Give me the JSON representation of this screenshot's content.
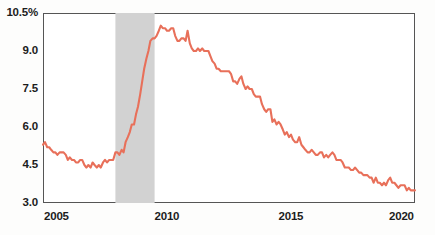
{
  "chart_data": {
    "type": "line",
    "title": "",
    "subtitle": "",
    "xlabel": "",
    "ylabel": "",
    "xlim": [
      2005.0,
      2020.0
    ],
    "ylim": [
      3.0,
      10.5
    ],
    "grid": false,
    "legend": "none",
    "line_color": "#e8705a",
    "recession_band_color": "#d2d2d2",
    "frame_color": "#555555",
    "y_ticks": [
      {
        "value": 3.0,
        "label": "3.0"
      },
      {
        "value": 4.5,
        "label": "4.5"
      },
      {
        "value": 6.0,
        "label": "6.0"
      },
      {
        "value": 7.5,
        "label": "7.5"
      },
      {
        "value": 9.0,
        "label": "9.0"
      },
      {
        "value": 10.5,
        "label": "10.5%"
      }
    ],
    "x_ticks": [
      {
        "value": 2005,
        "label": "2005"
      },
      {
        "value": 2010,
        "label": "2010"
      },
      {
        "value": 2015,
        "label": "2015"
      },
      {
        "value": 2020,
        "label": "2020"
      }
    ],
    "annotations": [
      {
        "type": "shaded-band",
        "name": "recession-band",
        "x_start": 2007.92,
        "x_end": 2009.5
      }
    ],
    "series": [
      {
        "name": "Unemployment rate",
        "x": [
          2005.0,
          2005.08,
          2005.17,
          2005.25,
          2005.33,
          2005.42,
          2005.5,
          2005.58,
          2005.67,
          2005.75,
          2005.83,
          2005.92,
          2006.0,
          2006.08,
          2006.17,
          2006.25,
          2006.33,
          2006.42,
          2006.5,
          2006.58,
          2006.67,
          2006.75,
          2006.83,
          2006.92,
          2007.0,
          2007.08,
          2007.17,
          2007.25,
          2007.33,
          2007.42,
          2007.5,
          2007.58,
          2007.67,
          2007.75,
          2007.83,
          2007.92,
          2008.0,
          2008.08,
          2008.17,
          2008.25,
          2008.33,
          2008.42,
          2008.5,
          2008.58,
          2008.67,
          2008.75,
          2008.83,
          2008.92,
          2009.0,
          2009.08,
          2009.17,
          2009.25,
          2009.33,
          2009.42,
          2009.5,
          2009.58,
          2009.67,
          2009.75,
          2009.83,
          2009.92,
          2010.0,
          2010.08,
          2010.17,
          2010.25,
          2010.33,
          2010.42,
          2010.5,
          2010.58,
          2010.67,
          2010.75,
          2010.83,
          2010.92,
          2011.0,
          2011.08,
          2011.17,
          2011.25,
          2011.33,
          2011.42,
          2011.5,
          2011.58,
          2011.67,
          2011.75,
          2011.83,
          2011.92,
          2012.0,
          2012.08,
          2012.17,
          2012.25,
          2012.33,
          2012.42,
          2012.5,
          2012.58,
          2012.67,
          2012.75,
          2012.83,
          2012.92,
          2013.0,
          2013.08,
          2013.17,
          2013.25,
          2013.33,
          2013.42,
          2013.5,
          2013.58,
          2013.67,
          2013.75,
          2013.83,
          2013.92,
          2014.0,
          2014.08,
          2014.17,
          2014.25,
          2014.33,
          2014.42,
          2014.5,
          2014.58,
          2014.67,
          2014.75,
          2014.83,
          2014.92,
          2015.0,
          2015.08,
          2015.17,
          2015.25,
          2015.33,
          2015.42,
          2015.5,
          2015.58,
          2015.67,
          2015.75,
          2015.83,
          2015.92,
          2016.0,
          2016.08,
          2016.17,
          2016.25,
          2016.33,
          2016.42,
          2016.5,
          2016.58,
          2016.67,
          2016.75,
          2016.83,
          2016.92,
          2017.0,
          2017.08,
          2017.17,
          2017.25,
          2017.33,
          2017.42,
          2017.5,
          2017.58,
          2017.67,
          2017.75,
          2017.83,
          2017.92,
          2018.0,
          2018.08,
          2018.17,
          2018.25,
          2018.33,
          2018.42,
          2018.5,
          2018.58,
          2018.67,
          2018.75,
          2018.83,
          2018.92,
          2019.0,
          2019.08,
          2019.17,
          2019.25,
          2019.33,
          2019.42,
          2019.5,
          2019.58,
          2019.67,
          2019.75,
          2019.83,
          2019.92,
          2020.0
        ],
        "values": [
          5.3,
          5.4,
          5.2,
          5.2,
          5.1,
          5.0,
          5.0,
          4.9,
          5.0,
          5.0,
          5.0,
          4.9,
          4.7,
          4.8,
          4.7,
          4.7,
          4.6,
          4.6,
          4.7,
          4.7,
          4.5,
          4.4,
          4.5,
          4.4,
          4.6,
          4.5,
          4.4,
          4.5,
          4.4,
          4.6,
          4.7,
          4.6,
          4.7,
          4.7,
          4.7,
          5.0,
          5.0,
          4.9,
          5.1,
          5.0,
          5.4,
          5.6,
          5.8,
          6.1,
          6.1,
          6.5,
          6.8,
          7.3,
          7.8,
          8.3,
          8.7,
          9.0,
          9.4,
          9.5,
          9.5,
          9.6,
          9.8,
          10.0,
          9.9,
          9.9,
          9.8,
          9.8,
          9.9,
          9.9,
          9.6,
          9.4,
          9.4,
          9.5,
          9.5,
          9.4,
          9.8,
          9.3,
          9.1,
          9.0,
          9.0,
          9.1,
          9.0,
          9.1,
          9.0,
          9.0,
          9.0,
          8.8,
          8.6,
          8.5,
          8.3,
          8.3,
          8.2,
          8.2,
          8.2,
          8.2,
          8.2,
          8.1,
          7.8,
          7.8,
          7.7,
          7.9,
          8.0,
          7.7,
          7.5,
          7.6,
          7.5,
          7.5,
          7.3,
          7.2,
          7.2,
          7.2,
          6.9,
          6.7,
          6.6,
          6.7,
          6.7,
          6.2,
          6.3,
          6.1,
          6.2,
          6.1,
          5.9,
          5.7,
          5.8,
          5.6,
          5.7,
          5.5,
          5.4,
          5.4,
          5.6,
          5.3,
          5.2,
          5.1,
          5.0,
          5.0,
          5.1,
          5.0,
          4.9,
          4.9,
          5.0,
          5.0,
          4.8,
          4.9,
          4.8,
          4.9,
          5.0,
          4.9,
          4.7,
          4.7,
          4.7,
          4.6,
          4.4,
          4.4,
          4.4,
          4.3,
          4.3,
          4.4,
          4.3,
          4.2,
          4.2,
          4.1,
          4.1,
          4.1,
          4.0,
          4.0,
          3.8,
          4.0,
          3.8,
          3.8,
          3.7,
          3.8,
          3.7,
          3.9,
          4.0,
          3.8,
          3.8,
          3.7,
          3.6,
          3.7,
          3.7,
          3.7,
          3.5,
          3.6,
          3.5,
          3.5,
          3.5
        ]
      }
    ]
  }
}
